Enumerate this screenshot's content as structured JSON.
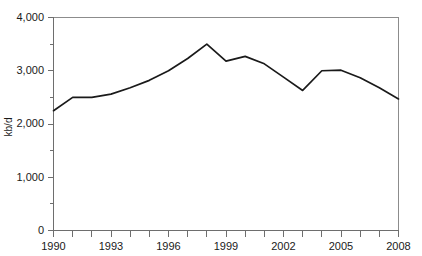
{
  "chart_data": {
    "type": "line",
    "title": "",
    "subtitle": "",
    "xlabel": "",
    "ylabel": "kb/d",
    "x": [
      1990,
      1991,
      1992,
      1993,
      1994,
      1995,
      1996,
      1997,
      1998,
      1999,
      2000,
      2001,
      2002,
      2003,
      2004,
      2005,
      2006,
      2007,
      2008
    ],
    "values": [
      2250,
      2500,
      2500,
      2560,
      2680,
      2820,
      3000,
      3230,
      3500,
      3180,
      3270,
      3130,
      2880,
      2630,
      3000,
      3010,
      2870,
      2680,
      2470
    ],
    "series": [
      {
        "name": "kb/d",
        "values": [
          2250,
          2500,
          2500,
          2560,
          2680,
          2820,
          3000,
          3230,
          3500,
          3180,
          3270,
          3130,
          2880,
          2630,
          3000,
          3010,
          2870,
          2680,
          2470
        ]
      }
    ],
    "xlim": [
      1990,
      2008
    ],
    "ylim": [
      0,
      4000
    ],
    "ytick_values": [
      0,
      1000,
      2000,
      3000,
      4000
    ],
    "ytick_labels": [
      "0",
      "1,000",
      "2,000",
      "3,000",
      "4,000"
    ],
    "yminor_values": [
      500,
      1500,
      2500,
      3500
    ],
    "xtick_values": [
      1990,
      1991,
      1992,
      1993,
      1994,
      1995,
      1996,
      1997,
      1998,
      1999,
      2000,
      2001,
      2002,
      2003,
      2004,
      2005,
      2006,
      2007,
      2008
    ],
    "xtick_labels_shown": [
      "1990",
      "1993",
      "1996",
      "1999",
      "2002",
      "2005",
      "2008"
    ],
    "xtick_labeled_values": [
      1990,
      1993,
      1996,
      1999,
      2002,
      2005,
      2008
    ],
    "grid": false,
    "legend": "none",
    "line_color": "#1a1a1a",
    "axis_color": "#6e6e6e",
    "frame_color": "#8c8c8c",
    "background": "#ffffff"
  },
  "labels": {
    "y_axis_title": "kb/d",
    "y_0": "0",
    "y_1000": "1,000",
    "y_2000": "2,000",
    "y_3000": "3,000",
    "y_4000": "4,000",
    "x_1990": "1990",
    "x_1993": "1993",
    "x_1996": "1996",
    "x_1999": "1999",
    "x_2002": "2002",
    "x_2005": "2005",
    "x_2008": "2008"
  }
}
